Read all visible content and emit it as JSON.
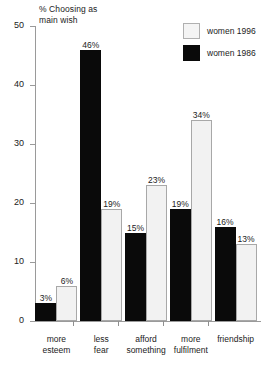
{
  "chart_data": {
    "type": "bar",
    "title": "",
    "ylabel": "% Choosing as\nmain wish",
    "xlabel": "",
    "ylim": [
      0,
      50
    ],
    "yticks": [
      0,
      10,
      20,
      30,
      40,
      50
    ],
    "ytick_labels": [
      "0",
      "10",
      "20",
      "30",
      "40",
      "50"
    ],
    "grid": false,
    "legend_position": "top-right",
    "categories": [
      "more\nesteem",
      "less\nfear",
      "afford\nsomething",
      "more\nfulfilment",
      "friendship"
    ],
    "series": [
      {
        "name": "women 1986",
        "color": "#0a0a0a",
        "values": [
          3,
          46,
          15,
          19,
          16
        ],
        "value_labels": [
          "3%",
          "46%",
          "15%",
          "19%",
          "16%"
        ]
      },
      {
        "name": "women 1996",
        "color": "#f2f2f2",
        "values": [
          6,
          19,
          23,
          34,
          13
        ],
        "value_labels": [
          "6%",
          "19%",
          "23%",
          "34%",
          "13%"
        ]
      }
    ]
  },
  "legend": {
    "items": [
      {
        "label": "women 1996",
        "swatch": "light"
      },
      {
        "label": "women 1986",
        "swatch": "dark"
      }
    ]
  }
}
